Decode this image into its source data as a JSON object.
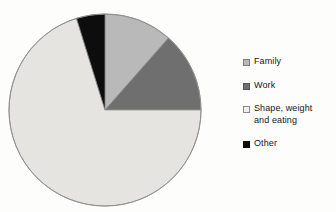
{
  "chart_data": {
    "type": "pie",
    "title": "",
    "subtitle": "",
    "xlabel": "",
    "ylabel": "",
    "grid": false,
    "legend_position": "right",
    "start_angle_deg": 0,
    "direction": "clockwise",
    "categories": [
      "Family",
      "Work",
      "Shape, weight and eating",
      "Other"
    ],
    "values": [
      11.5,
      13.5,
      70.2,
      4.8
    ],
    "slices": [
      {
        "label": "Family",
        "value": 11.5,
        "color": "#b9b9b9",
        "start_angle_deg": 0,
        "end_angle_deg": 41.4
      },
      {
        "label": "Work",
        "value": 13.5,
        "color": "#6f6f6f",
        "start_angle_deg": 41.4,
        "end_angle_deg": 90
      },
      {
        "label": "Shape, weight and eating",
        "value": 70.2,
        "color": "#e5e4e0",
        "start_angle_deg": 90,
        "end_angle_deg": 342.7
      },
      {
        "label": "Other",
        "value": 4.8,
        "color": "#0d0d0d",
        "start_angle_deg": 342.7,
        "end_angle_deg": 360
      }
    ],
    "colors": [
      "#b9b9b9",
      "#6f6f6f",
      "#e5e4e0",
      "#0d0d0d"
    ],
    "outline_color": "#8f8f8f"
  },
  "legend": {
    "items": [
      {
        "label": "Family",
        "color": "#b9b9b9",
        "border": "#7e7e7e",
        "wrap": false
      },
      {
        "label": "Work",
        "color": "#6f6f6f",
        "border": "#575757",
        "wrap": false
      },
      {
        "label": "Shape, weight\nand eating",
        "color": "#f0efec",
        "border": "#8a8a8a",
        "wrap": true
      },
      {
        "label": "Other",
        "color": "#0d0d0d",
        "border": "#0d0d0d",
        "wrap": false
      }
    ]
  },
  "figure": {
    "background": "#fdfdfc",
    "center_x": 98,
    "center_y": 98,
    "radius": 96
  }
}
